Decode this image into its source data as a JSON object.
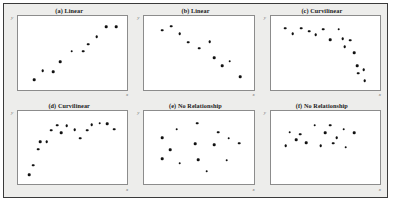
{
  "figure": {
    "background_color": "#ededeb",
    "panel_background_color": "#ffffff",
    "border_color": "#3a3a3a",
    "dot_color": "#111111",
    "axis_color": "#8c8c8c"
  },
  "axes_labels": {
    "x": "x",
    "y": "y"
  },
  "chart_data": [
    {
      "type": "scatter",
      "panel": "a",
      "title": "(a) Linear",
      "xlabel": "x",
      "ylabel": "y",
      "xlim": [
        0,
        100
      ],
      "ylim": [
        0,
        100
      ],
      "grid": false,
      "legend": "none",
      "relationship": "positive linear",
      "points": [
        {
          "x": 10,
          "y": 8
        },
        {
          "x": 19,
          "y": 22
        },
        {
          "x": 30,
          "y": 21
        },
        {
          "x": 37,
          "y": 36
        },
        {
          "x": 49,
          "y": 52
        },
        {
          "x": 61,
          "y": 52
        },
        {
          "x": 66,
          "y": 63
        },
        {
          "x": 75,
          "y": 75
        },
        {
          "x": 85,
          "y": 90
        },
        {
          "x": 95,
          "y": 90
        }
      ]
    },
    {
      "type": "scatter",
      "panel": "b",
      "title": "(b) Linear",
      "xlabel": "x",
      "ylabel": "y",
      "xlim": [
        0,
        100
      ],
      "ylim": [
        0,
        100
      ],
      "grid": false,
      "legend": "none",
      "relationship": "negative linear",
      "points": [
        {
          "x": 12,
          "y": 85
        },
        {
          "x": 21,
          "y": 91
        },
        {
          "x": 30,
          "y": 79
        },
        {
          "x": 39,
          "y": 66
        },
        {
          "x": 50,
          "y": 57
        },
        {
          "x": 61,
          "y": 67
        },
        {
          "x": 66,
          "y": 42
        },
        {
          "x": 74,
          "y": 30
        },
        {
          "x": 82,
          "y": 37
        },
        {
          "x": 93,
          "y": 13
        }
      ]
    },
    {
      "type": "scatter",
      "panel": "c",
      "title": "(c) Curvilinear",
      "xlabel": "x",
      "ylabel": "y",
      "xlim": [
        0,
        100
      ],
      "ylim": [
        0,
        100
      ],
      "grid": false,
      "legend": "none",
      "relationship": "curvilinear decreasing",
      "points": [
        {
          "x": 8,
          "y": 88
        },
        {
          "x": 16,
          "y": 79
        },
        {
          "x": 25,
          "y": 88
        },
        {
          "x": 33,
          "y": 83
        },
        {
          "x": 40,
          "y": 78
        },
        {
          "x": 48,
          "y": 86
        },
        {
          "x": 55,
          "y": 70
        },
        {
          "x": 64,
          "y": 86
        },
        {
          "x": 68,
          "y": 72
        },
        {
          "x": 70,
          "y": 59
        },
        {
          "x": 76,
          "y": 69
        },
        {
          "x": 80,
          "y": 50
        },
        {
          "x": 83,
          "y": 30
        },
        {
          "x": 84,
          "y": 18
        },
        {
          "x": 90,
          "y": 24
        },
        {
          "x": 91,
          "y": 7
        }
      ]
    },
    {
      "type": "scatter",
      "panel": "d",
      "title": "(d) Curvilinear",
      "xlabel": "x",
      "ylabel": "y",
      "xlim": [
        0,
        100
      ],
      "ylim": [
        0,
        100
      ],
      "grid": false,
      "legend": "none",
      "relationship": "curvilinear increasing plateau",
      "points": [
        {
          "x": 5,
          "y": 7
        },
        {
          "x": 9,
          "y": 22
        },
        {
          "x": 14,
          "y": 47
        },
        {
          "x": 16,
          "y": 58
        },
        {
          "x": 23,
          "y": 58
        },
        {
          "x": 28,
          "y": 76
        },
        {
          "x": 34,
          "y": 84
        },
        {
          "x": 38,
          "y": 72
        },
        {
          "x": 44,
          "y": 83
        },
        {
          "x": 52,
          "y": 77
        },
        {
          "x": 58,
          "y": 64
        },
        {
          "x": 65,
          "y": 76
        },
        {
          "x": 70,
          "y": 85
        },
        {
          "x": 78,
          "y": 87
        },
        {
          "x": 86,
          "y": 86
        },
        {
          "x": 93,
          "y": 78
        }
      ]
    },
    {
      "type": "scatter",
      "panel": "e",
      "title": "(e) No Relationship",
      "xlabel": "x",
      "ylabel": "y",
      "xlim": [
        0,
        100
      ],
      "ylim": [
        0,
        100
      ],
      "grid": false,
      "legend": "none",
      "relationship": "none",
      "points": [
        {
          "x": 12,
          "y": 65
        },
        {
          "x": 12,
          "y": 32
        },
        {
          "x": 20,
          "y": 46
        },
        {
          "x": 27,
          "y": 78
        },
        {
          "x": 30,
          "y": 25
        },
        {
          "x": 46,
          "y": 55
        },
        {
          "x": 48,
          "y": 87
        },
        {
          "x": 49,
          "y": 31
        },
        {
          "x": 58,
          "y": 13
        },
        {
          "x": 66,
          "y": 54
        },
        {
          "x": 70,
          "y": 73
        },
        {
          "x": 79,
          "y": 30
        },
        {
          "x": 81,
          "y": 64
        },
        {
          "x": 92,
          "y": 56
        }
      ]
    },
    {
      "type": "scatter",
      "panel": "f",
      "title": "(f) No Relationship",
      "xlabel": "x",
      "ylabel": "y",
      "xlim": [
        0,
        100
      ],
      "ylim": [
        0,
        100
      ],
      "grid": false,
      "legend": "none",
      "relationship": "none",
      "points": [
        {
          "x": 9,
          "y": 52
        },
        {
          "x": 13,
          "y": 73
        },
        {
          "x": 20,
          "y": 62
        },
        {
          "x": 24,
          "y": 70
        },
        {
          "x": 30,
          "y": 57
        },
        {
          "x": 39,
          "y": 84
        },
        {
          "x": 45,
          "y": 52
        },
        {
          "x": 50,
          "y": 72
        },
        {
          "x": 55,
          "y": 84
        },
        {
          "x": 58,
          "y": 56
        },
        {
          "x": 62,
          "y": 65
        },
        {
          "x": 69,
          "y": 78
        },
        {
          "x": 71,
          "y": 50
        },
        {
          "x": 80,
          "y": 72
        }
      ]
    }
  ]
}
